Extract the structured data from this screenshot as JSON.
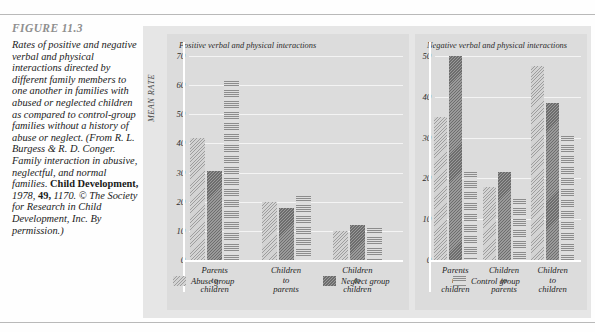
{
  "figure": {
    "label": "FIGURE 11.3",
    "caption_parts": {
      "p1": "Rates of positive and negative verbal and physical interactions directed by different family members to one another in families with abused or neglected children as compared to control-group families without a history of abuse or neglect. (From R. L. Burgess & R. D. Conger. Family interaction in abusive, neglectful, and normal families. ",
      "journal": "Child Development,",
      "p2": " 1978, ",
      "volume": "49,",
      "p3": " 1170. © The Society for Research in Child Development, Inc. By permission.)"
    }
  },
  "chart_data": [
    {
      "type": "bar",
      "title": "Positive verbal and physical interactions",
      "xlabel": "",
      "ylabel": "MEAN RATE",
      "ylim": [
        0,
        70
      ],
      "yticks": [
        0,
        10,
        20,
        30,
        40,
        50,
        60,
        70
      ],
      "grid": true,
      "legend_position": "bottom",
      "categories": [
        "Parents to children",
        "Children to parents",
        "Children to children"
      ],
      "category_lines": [
        [
          "Parents",
          "to",
          "children"
        ],
        [
          "Children",
          "to",
          "parents"
        ],
        [
          "Children",
          "to",
          "children"
        ]
      ],
      "series": [
        {
          "name": "Abuse group",
          "values": [
            42,
            20,
            10
          ]
        },
        {
          "name": "Neglect group",
          "values": [
            30.5,
            18,
            12
          ]
        },
        {
          "name": "Control group",
          "values": [
            61.5,
            22,
            11
          ]
        }
      ]
    },
    {
      "type": "bar",
      "title": "Negative verbal and physical interactions",
      "xlabel": "",
      "ylabel": "MEAN RATE",
      "ylim": [
        0,
        50
      ],
      "yticks": [
        0,
        10,
        20,
        30,
        40,
        50
      ],
      "grid": true,
      "legend_position": "bottom",
      "categories": [
        "Parents to children",
        "Children to parents",
        "Children to children"
      ],
      "category_lines": [
        [
          "Parents",
          "to",
          "children"
        ],
        [
          "Children",
          "to",
          "parents"
        ],
        [
          "Children",
          "to",
          "children"
        ]
      ],
      "series": [
        {
          "name": "Abuse group",
          "values": [
            35,
            18,
            47.5
          ]
        },
        {
          "name": "Neglect group",
          "values": [
            50,
            21.5,
            38.5
          ]
        },
        {
          "name": "Control group",
          "values": [
            21.5,
            15,
            30.5
          ]
        }
      ]
    }
  ],
  "legend": {
    "items": [
      {
        "label": "Abuse group",
        "pattern": "light-diagonal-hatch",
        "color": "#d3d3d3"
      },
      {
        "label": "Neglect group",
        "pattern": "dark-diagonal-hatch",
        "color": "#9a9a9a"
      },
      {
        "label": "Control group",
        "pattern": "horizontal-lines",
        "color": "#dedede"
      }
    ]
  },
  "colors": {
    "page_background": "#fefefe",
    "plate_background": "#e6e6e6",
    "panel_background": "#dcdcdc",
    "gridline": "#f4f4f4",
    "axis": "#ffffff",
    "text": "#1f1f1f",
    "figure_label": "#8f8f8f"
  }
}
